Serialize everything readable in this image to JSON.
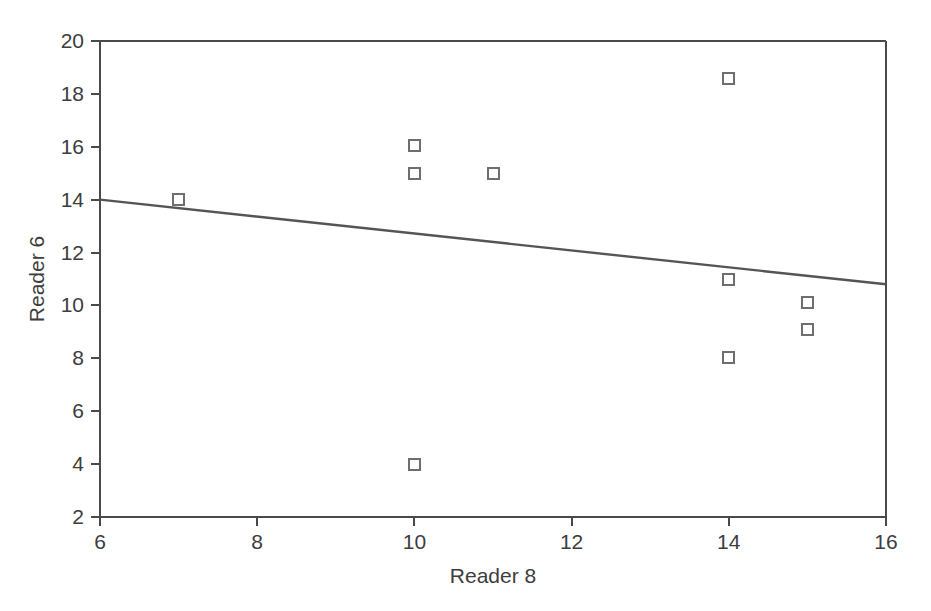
{
  "chart_data": {
    "type": "scatter",
    "title": "",
    "xlabel": "Reader 8",
    "ylabel": "Reader 6",
    "xlim": [
      6,
      16
    ],
    "ylim": [
      2,
      20
    ],
    "xticks": [
      6,
      8,
      10,
      12,
      14,
      16
    ],
    "yticks": [
      2,
      4,
      6,
      8,
      10,
      12,
      14,
      16,
      18,
      20
    ],
    "xtick_labels": [
      "6",
      "8",
      "10",
      "12",
      "14",
      "16"
    ],
    "ytick_labels": [
      "2",
      "4",
      "6",
      "8",
      "10",
      "12",
      "14",
      "16",
      "18",
      "20"
    ],
    "grid": false,
    "legend": null,
    "marker_style": "open-square",
    "marker_color": "#6e6e6e",
    "points": [
      {
        "x": 7,
        "y": 14.0
      },
      {
        "x": 10,
        "y": 16.05
      },
      {
        "x": 10,
        "y": 15.0
      },
      {
        "x": 10,
        "y": 4.0
      },
      {
        "x": 11,
        "y": 15.0
      },
      {
        "x": 14,
        "y": 18.6
      },
      {
        "x": 14,
        "y": 11.0
      },
      {
        "x": 14,
        "y": 8.05
      },
      {
        "x": 15,
        "y": 10.1
      },
      {
        "x": 15,
        "y": 9.1
      }
    ],
    "series": [
      {
        "name": "observations",
        "type": "scatter",
        "x": [
          7,
          10,
          10,
          10,
          11,
          14,
          14,
          14,
          15,
          15
        ],
        "y": [
          14.0,
          16.05,
          15.0,
          4.0,
          15.0,
          18.6,
          11.0,
          8.05,
          10.1,
          9.1
        ]
      },
      {
        "name": "fit-line",
        "type": "line",
        "x": [
          6,
          16
        ],
        "y": [
          14.0,
          10.8
        ],
        "color": "#555555"
      }
    ],
    "trend_line": {
      "x_start": 6,
      "y_start": 14.0,
      "x_end": 16,
      "y_end": 10.8,
      "slope": -0.32,
      "intercept": 15.92
    },
    "axes_color": "#4a4a4a",
    "background_color": "#ffffff"
  }
}
